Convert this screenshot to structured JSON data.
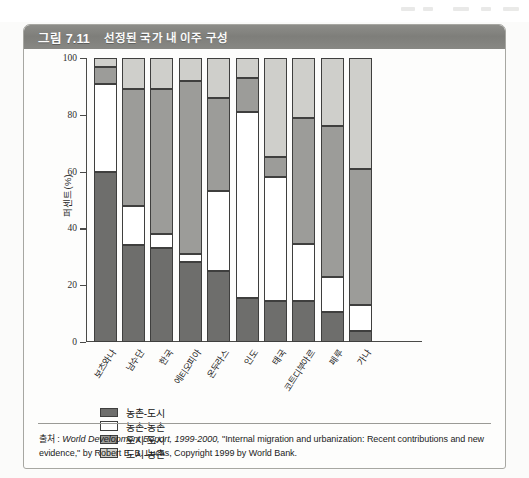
{
  "figure": {
    "number": "그림 7.11",
    "title": "선정된 국가 내 이주 구성"
  },
  "source": {
    "prefix": "출처 : ",
    "italic_part": "World Development Report, 1999-2000,",
    "rest": " \"Internal migration and urbanization: Recent contributions and new evidence,\" by Robert E. B. Lucas, Copyright 1999 by World Bank."
  },
  "chart_data": {
    "type": "bar",
    "stacked": true,
    "title": "선정된 국가 내 이주 구성",
    "xlabel": "",
    "ylabel": "퍼센트(%)",
    "ylim": [
      0,
      100
    ],
    "yticks": [
      0,
      20,
      40,
      60,
      80,
      100
    ],
    "grid": false,
    "legend_position": "below-left",
    "categories": [
      "보츠와나",
      "남수단",
      "한국",
      "에티오피아",
      "온두라스",
      "인도",
      "태국",
      "코트디부아르",
      "페루",
      "가나"
    ],
    "series": [
      {
        "name": "농촌-도시",
        "color": "#6e6e6c",
        "values": [
          60,
          34,
          33,
          28,
          25,
          15.5,
          14.5,
          14.5,
          10.5,
          4
        ]
      },
      {
        "name": "농촌-농촌",
        "color": "#ffffff",
        "values": [
          31,
          14,
          5,
          3,
          28,
          65.5,
          43.5,
          20,
          12.5,
          9
        ]
      },
      {
        "name": "도시-도시",
        "color": "#9c9c99",
        "values": [
          6,
          41,
          51,
          61,
          33,
          12,
          7,
          44.5,
          53,
          48
        ]
      },
      {
        "name": "도시-농촌",
        "color": "#cfcfcb",
        "values": [
          3,
          11,
          11,
          8,
          14,
          7,
          35,
          21,
          24,
          39
        ]
      }
    ]
  }
}
